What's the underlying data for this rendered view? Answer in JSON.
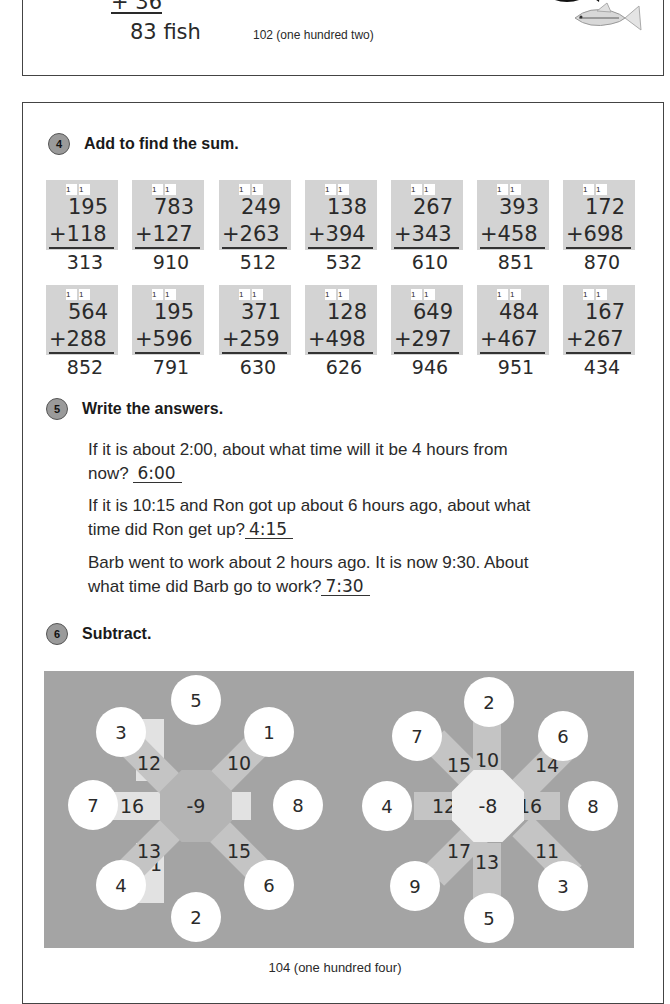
{
  "top_fragment": {
    "addend": "+ 36",
    "total": "83 fish",
    "page_number": "102 (one hundred  two)"
  },
  "exercise4": {
    "number": "4",
    "title": "Add to find the sum.",
    "problems": [
      {
        "carry": [
          "1",
          "1"
        ],
        "top": "195",
        "bottom": "+118",
        "answer": "313"
      },
      {
        "carry": [
          "1",
          "1"
        ],
        "top": "783",
        "bottom": "+127",
        "answer": "910"
      },
      {
        "carry": [
          "1",
          "1"
        ],
        "top": "249",
        "bottom": "+263",
        "answer": "512"
      },
      {
        "carry": [
          "1",
          "1"
        ],
        "top": "138",
        "bottom": "+394",
        "answer": "532"
      },
      {
        "carry": [
          "1",
          "1"
        ],
        "top": "267",
        "bottom": "+343",
        "answer": "610"
      },
      {
        "carry": [
          "1",
          "1"
        ],
        "top": "393",
        "bottom": "+458",
        "answer": "851"
      },
      {
        "carry": [
          "1",
          "1"
        ],
        "top": "172",
        "bottom": "+698",
        "answer": "870"
      },
      {
        "carry": [
          "1",
          "1"
        ],
        "top": "564",
        "bottom": "+288",
        "answer": "852"
      },
      {
        "carry": [
          "1",
          "1"
        ],
        "top": "195",
        "bottom": "+596",
        "answer": "791"
      },
      {
        "carry": [
          "1",
          "1"
        ],
        "top": "371",
        "bottom": "+259",
        "answer": "630"
      },
      {
        "carry": [
          "1",
          "1"
        ],
        "top": "128",
        "bottom": "+498",
        "answer": "626"
      },
      {
        "carry": [
          "1",
          "1"
        ],
        "top": "649",
        "bottom": "+297",
        "answer": "946"
      },
      {
        "carry": [
          "1",
          "1"
        ],
        "top": "484",
        "bottom": "+467",
        "answer": "951"
      },
      {
        "carry": [
          "1",
          "1"
        ],
        "top": "167",
        "bottom": "+267",
        "answer": "434"
      }
    ]
  },
  "exercise5": {
    "number": "5",
    "title": "Write the answers.",
    "questions": [
      {
        "line1": "If it is about 2:00, about what time will it be 4 hours from",
        "line2": "now?",
        "answer": "6:00"
      },
      {
        "line1": "If it is 10:15 and Ron got up about 6 hours ago, about what",
        "line2": "time did Ron get up?",
        "answer": "4:15"
      },
      {
        "line1": "Barb went to work about 2 hours ago.  It is now 9:30.  About",
        "line2": "what time did Barb go to work?",
        "answer": "7:30"
      }
    ]
  },
  "exercise6": {
    "number": "6",
    "title": "Subtract.",
    "wheels": [
      {
        "center": "-9",
        "spokes": {
          "n": "14",
          "ne": "10",
          "e": "17",
          "se": "15",
          "s": "11",
          "sw": "13",
          "w": "16",
          "nw": "12"
        },
        "petals": {
          "n": "5",
          "ne": "1",
          "e": "8",
          "se": "6",
          "s": "2",
          "sw": "4",
          "w": "7",
          "nw": "3"
        }
      },
      {
        "center": "-8",
        "spokes": {
          "n": "10",
          "ne": "14",
          "e": "16",
          "se": "11",
          "s": "13",
          "sw": "17",
          "w": "12",
          "nw": "15"
        },
        "petals": {
          "n": "2",
          "ne": "6",
          "e": "8",
          "se": "3",
          "s": "5",
          "sw": "9",
          "w": "4",
          "nw": "7"
        }
      }
    ]
  },
  "footer": {
    "page_number": "104 (one hundred four)"
  },
  "colors": {
    "card_bg": "#d3d3d3",
    "panel_bg": "#a4a4a4",
    "badge_bg": "#9a9a9a"
  }
}
